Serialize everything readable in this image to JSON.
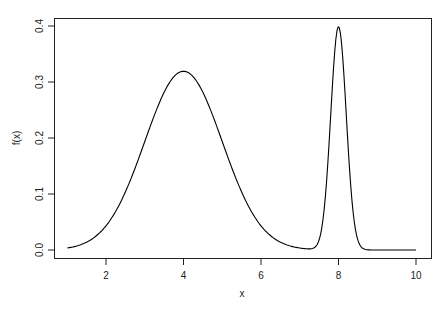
{
  "chart_data": {
    "type": "line",
    "title": "",
    "xlabel": "x",
    "ylabel": "f(x)",
    "xlim": [
      1,
      10
    ],
    "ylim": [
      0,
      0.4
    ],
    "x_ticks": [
      2,
      4,
      6,
      8,
      10
    ],
    "x_tick_labels": [
      "2",
      "4",
      "6",
      "8",
      "10"
    ],
    "y_ticks": [
      0.0,
      0.1,
      0.2,
      0.3,
      0.4
    ],
    "y_tick_labels": [
      "0.0",
      "0.1",
      "0.2",
      "0.3",
      "0.4"
    ],
    "grid": false,
    "legend": null,
    "line_color": "#000000",
    "series": [
      {
        "name": "f(x)",
        "x": [
          1.0,
          1.5,
          2.0,
          2.5,
          3.0,
          3.5,
          4.0,
          4.5,
          5.0,
          5.5,
          6.0,
          6.5,
          7.0,
          7.3,
          7.5,
          7.6,
          7.7,
          7.8,
          7.9,
          8.0,
          8.1,
          8.2,
          8.3,
          8.4,
          8.5,
          8.6,
          8.7,
          9.0,
          9.5,
          10.0
        ],
        "values": [
          0.004,
          0.014,
          0.043,
          0.104,
          0.194,
          0.282,
          0.319,
          0.282,
          0.194,
          0.104,
          0.043,
          0.014,
          0.004,
          0.002,
          0.018,
          0.055,
          0.13,
          0.242,
          0.352,
          0.399,
          0.352,
          0.242,
          0.13,
          0.054,
          0.018,
          0.004,
          0.001,
          0.0,
          0.0,
          0.0
        ]
      }
    ]
  }
}
